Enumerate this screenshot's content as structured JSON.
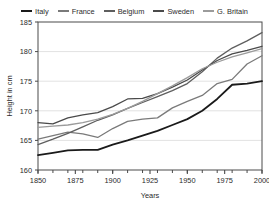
{
  "chart_data": {
    "type": "line",
    "title": "",
    "xlabel": "Years",
    "ylabel": "Height in cm",
    "xlim": [
      1850,
      2000
    ],
    "ylim": [
      160,
      185
    ],
    "xticks": [
      1850,
      1875,
      1900,
      1925,
      1950,
      1975,
      2000
    ],
    "yticks": [
      160,
      165,
      170,
      175,
      180,
      185
    ],
    "xtick_labels": [
      "1850",
      "1875",
      "1900",
      "1925",
      "1950",
      "1975",
      "2000"
    ],
    "ytick_labels": [
      "160",
      "165",
      "170",
      "175",
      "180",
      "185"
    ],
    "minor_xtick_step": 10,
    "grid": "horizontal",
    "legend_position": "top-center",
    "x": [
      1850,
      1860,
      1870,
      1880,
      1890,
      1900,
      1910,
      1920,
      1930,
      1940,
      1950,
      1960,
      1970,
      1980,
      1990,
      2000
    ],
    "series": [
      {
        "name": "Italy",
        "color": "#1a1a1a",
        "values": [
          162.5,
          162.9,
          163.3,
          163.4,
          163.4,
          164.3,
          165.0,
          165.8,
          166.6,
          167.6,
          168.6,
          170.0,
          172.0,
          174.4,
          174.6,
          175.0
        ]
      },
      {
        "name": "France",
        "color": "#7a7a7a",
        "values": [
          165.2,
          165.8,
          166.4,
          166.1,
          165.5,
          167.0,
          168.2,
          168.6,
          168.8,
          170.5,
          171.6,
          172.6,
          174.6,
          175.3,
          177.9,
          179.3
        ]
      },
      {
        "name": "Belgium",
        "color": "#5e5e5e",
        "values": [
          164.3,
          165.2,
          166.2,
          167.3,
          168.4,
          169.3,
          170.4,
          171.4,
          172.4,
          173.4,
          174.6,
          176.6,
          178.9,
          180.6,
          181.8,
          183.2
        ]
      },
      {
        "name": "Sweden",
        "color": "#4a4a4a",
        "values": [
          168.0,
          167.8,
          168.8,
          169.3,
          169.7,
          170.7,
          172.0,
          172.1,
          172.9,
          174.0,
          175.2,
          176.9,
          178.5,
          179.6,
          180.2,
          180.9
        ]
      },
      {
        "name": "G. Britain",
        "color": "#9b9b9b",
        "values": [
          167.2,
          167.4,
          167.6,
          168.0,
          168.6,
          169.4,
          170.4,
          171.6,
          172.9,
          174.2,
          175.6,
          177.1,
          178.2,
          179.1,
          179.8,
          180.5
        ]
      }
    ]
  },
  "colors": {
    "axis": "#4a4a4a",
    "grid": "#e2e2e2",
    "text": "#2b2b2b",
    "background": "#ffffff"
  }
}
